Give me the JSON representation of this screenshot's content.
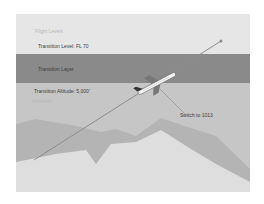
{
  "diagram": {
    "labels": {
      "flight_levels": "Flight Levels",
      "transition_level": "Transition Level: FL 70",
      "transition_layer": "Transition Layer",
      "transition_altitude": "Transition Altitude: 5,000'",
      "altitudes": "Altitudes",
      "switch": "Switch to 1013"
    },
    "colors": {
      "sky_upper": "#e6e6e6",
      "transition_layer": "#8a8a8a",
      "altitude_zone": "#c6c6c6",
      "terrain": "#b0b0b0",
      "ground": "#dedede",
      "flight_path": "#8c8c8c"
    }
  }
}
